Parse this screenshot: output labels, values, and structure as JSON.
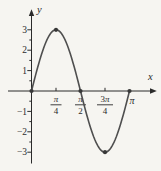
{
  "chart_data": {
    "type": "line",
    "title": "",
    "curve": {
      "amplitude": 3,
      "frequency": 2,
      "x_start_in_pi": 0,
      "x_end_in_pi": 1
    },
    "x_axis": {
      "label": "x",
      "range_in_pi": [
        0,
        1
      ],
      "ticks": [
        {
          "pos_in_pi": 0.25,
          "numerator": "π",
          "denominator": "4",
          "tick_mark": true
        },
        {
          "pos_in_pi": 0.5,
          "numerator": "π",
          "denominator": "2",
          "tick_mark": false
        },
        {
          "pos_in_pi": 0.75,
          "numerator": "3π",
          "denominator": "4",
          "tick_mark": true
        },
        {
          "pos_in_pi": 1,
          "label": "π",
          "tick_mark": false
        }
      ]
    },
    "y_axis": {
      "label": "y",
      "range": [
        -3,
        3
      ],
      "major_ticks": [
        {
          "value": 3,
          "label": "3"
        },
        {
          "value": 2,
          "label": "2"
        },
        {
          "value": 1,
          "label": "1"
        },
        {
          "value": -1,
          "label": "−1"
        },
        {
          "value": -2,
          "label": "−2"
        },
        {
          "value": -3,
          "label": "−3"
        }
      ],
      "minor_tick_values": [
        2.5,
        1.5,
        0.5,
        -0.5,
        -1.5,
        -2.5
      ]
    },
    "marked_points": [
      {
        "x_in_pi": 0,
        "y": 0
      },
      {
        "x_in_pi": 0.25,
        "y": 3
      },
      {
        "x_in_pi": 0.5,
        "y": 0
      },
      {
        "x_in_pi": 0.75,
        "y": -3
      },
      {
        "x_in_pi": 1,
        "y": 0
      }
    ],
    "colors": {
      "background": "#f6f5f1",
      "axis": "#2b2b2b",
      "text": "#2b2b2b",
      "curve": "#4f4f4f",
      "point": "#383838"
    },
    "grid": "off",
    "legend": "none"
  }
}
